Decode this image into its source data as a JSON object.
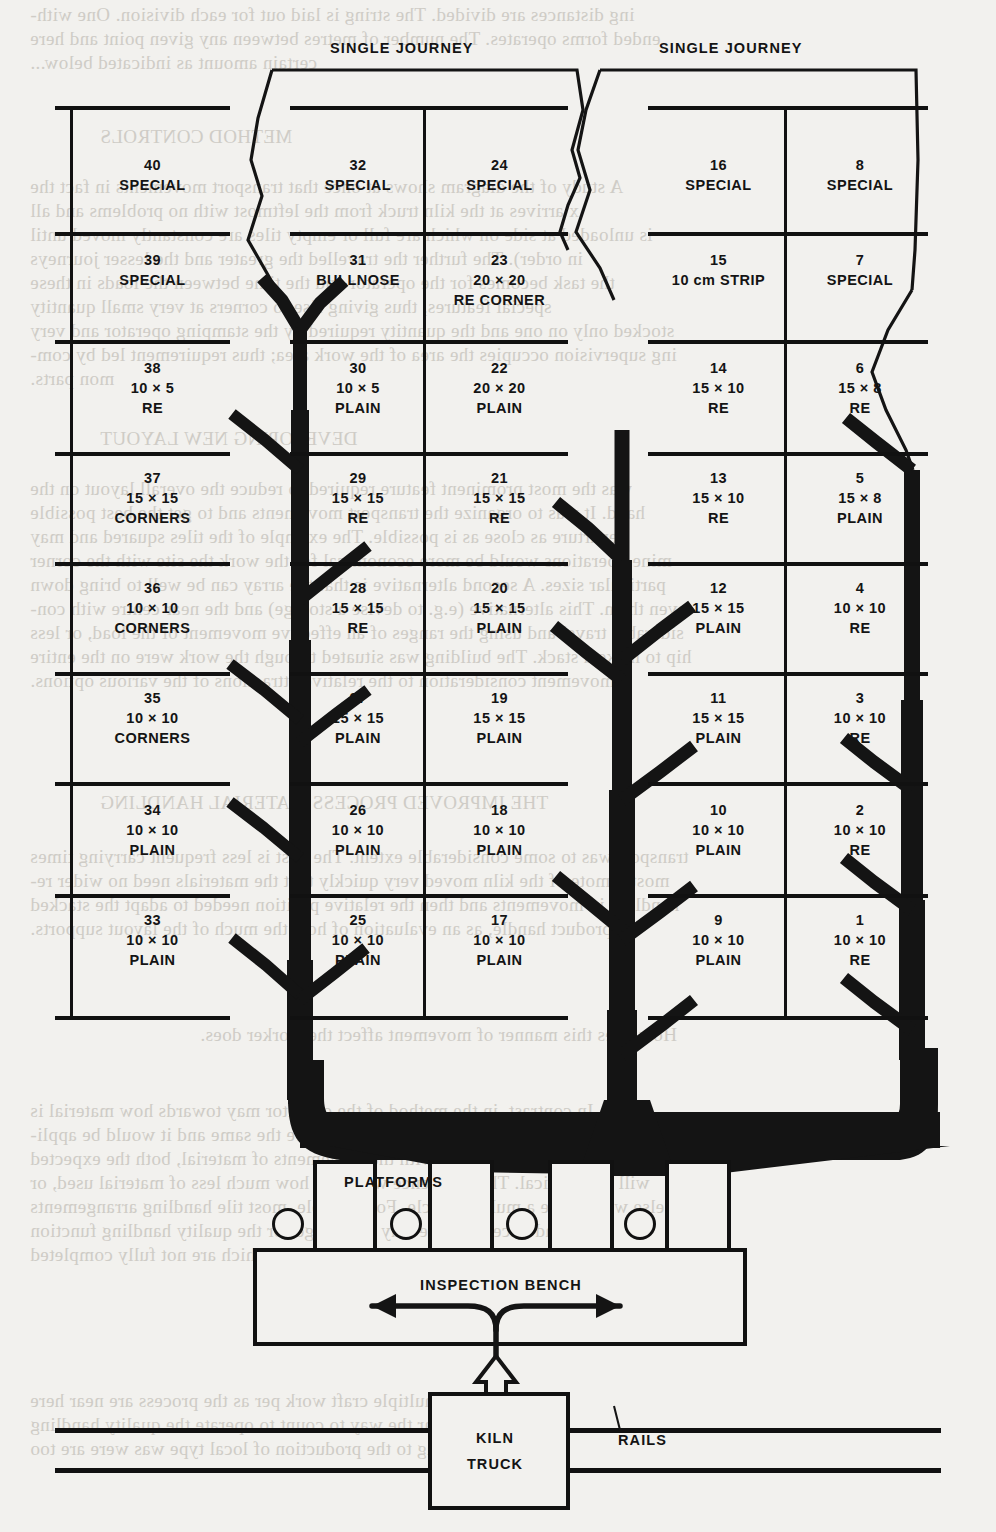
{
  "diagram": {
    "journey_labels": [
      {
        "text": "SINGLE JOURNEY",
        "x": 330,
        "y": 40
      },
      {
        "text": "SINGLE JOURNEY",
        "x": 659,
        "y": 40
      }
    ],
    "columns": [
      {
        "id": "col-40s",
        "left": 75,
        "width": 155
      },
      {
        "id": "col-30s",
        "left": 293,
        "width": 130
      },
      {
        "id": "col-20s",
        "left": 432,
        "width": 135
      },
      {
        "id": "col-10s",
        "left": 651,
        "width": 135
      },
      {
        "id": "col-00s",
        "left": 795,
        "width": 130
      }
    ],
    "cells": [
      {
        "num": "40",
        "d1": "SPECIAL",
        "d2": "",
        "col": 0,
        "row": 0
      },
      {
        "num": "39",
        "d1": "SPECIAL",
        "d2": "",
        "col": 0,
        "row": 1
      },
      {
        "num": "38",
        "d1": "10 × 5",
        "d2": "RE",
        "col": 0,
        "row": 2
      },
      {
        "num": "37",
        "d1": "15 × 15",
        "d2": "CORNERS",
        "col": 0,
        "row": 3
      },
      {
        "num": "36",
        "d1": "10 × 10",
        "d2": "CORNERS",
        "col": 0,
        "row": 4
      },
      {
        "num": "35",
        "d1": "10 × 10",
        "d2": "CORNERS",
        "col": 0,
        "row": 5
      },
      {
        "num": "34",
        "d1": "10 × 10",
        "d2": "PLAIN",
        "col": 0,
        "row": 6
      },
      {
        "num": "33",
        "d1": "10 × 10",
        "d2": "PLAIN",
        "col": 0,
        "row": 7
      },
      {
        "num": "32",
        "d1": "SPECIAL",
        "d2": "",
        "col": 1,
        "row": 0
      },
      {
        "num": "31",
        "d1": "BULLNOSE",
        "d2": "",
        "col": 1,
        "row": 1
      },
      {
        "num": "30",
        "d1": "10 × 5",
        "d2": "PLAIN",
        "col": 1,
        "row": 2
      },
      {
        "num": "29",
        "d1": "15 × 15",
        "d2": "RE",
        "col": 1,
        "row": 3
      },
      {
        "num": "28",
        "d1": "15 × 15",
        "d2": "RE",
        "col": 1,
        "row": 4
      },
      {
        "num": "27",
        "d1": "15 × 15",
        "d2": "PLAIN",
        "col": 1,
        "row": 5
      },
      {
        "num": "26",
        "d1": "10 × 10",
        "d2": "PLAIN",
        "col": 1,
        "row": 6
      },
      {
        "num": "25",
        "d1": "10 × 10",
        "d2": "PLAIN",
        "col": 1,
        "row": 7
      },
      {
        "num": "24",
        "d1": "SPECIAL",
        "d2": "",
        "col": 2,
        "row": 0
      },
      {
        "num": "23",
        "d1": "20 × 20",
        "d2": "RE CORNER",
        "col": 2,
        "row": 1
      },
      {
        "num": "22",
        "d1": "20 × 20",
        "d2": "PLAIN",
        "col": 2,
        "row": 2
      },
      {
        "num": "21",
        "d1": "15 × 15",
        "d2": "RE",
        "col": 2,
        "row": 3
      },
      {
        "num": "20",
        "d1": "15 × 15",
        "d2": "PLAIN",
        "col": 2,
        "row": 4
      },
      {
        "num": "19",
        "d1": "15 × 15",
        "d2": "PLAIN",
        "col": 2,
        "row": 5
      },
      {
        "num": "18",
        "d1": "10 × 10",
        "d2": "PLAIN",
        "col": 2,
        "row": 6
      },
      {
        "num": "17",
        "d1": "10 × 10",
        "d2": "PLAIN",
        "col": 2,
        "row": 7
      },
      {
        "num": "16",
        "d1": "SPECIAL",
        "d2": "",
        "col": 3,
        "row": 0
      },
      {
        "num": "15",
        "d1": "10 cm STRIP",
        "d2": "",
        "col": 3,
        "row": 1
      },
      {
        "num": "14",
        "d1": "15 × 10",
        "d2": "RE",
        "col": 3,
        "row": 2
      },
      {
        "num": "13",
        "d1": "15 × 10",
        "d2": "RE",
        "col": 3,
        "row": 3
      },
      {
        "num": "12",
        "d1": "15 × 15",
        "d2": "PLAIN",
        "col": 3,
        "row": 4
      },
      {
        "num": "11",
        "d1": "15 × 15",
        "d2": "PLAIN",
        "col": 3,
        "row": 5
      },
      {
        "num": "10",
        "d1": "10 × 10",
        "d2": "PLAIN",
        "col": 3,
        "row": 6
      },
      {
        "num": "9",
        "d1": "10 × 10",
        "d2": "PLAIN",
        "col": 3,
        "row": 7
      },
      {
        "num": "8",
        "d1": "SPECIAL",
        "d2": "",
        "col": 4,
        "row": 0
      },
      {
        "num": "7",
        "d1": "SPECIAL",
        "d2": "",
        "col": 4,
        "row": 1
      },
      {
        "num": "6",
        "d1": "15 × 8",
        "d2": "RE",
        "col": 4,
        "row": 2
      },
      {
        "num": "5",
        "d1": "15 × 8",
        "d2": "PLAIN",
        "col": 4,
        "row": 3
      },
      {
        "num": "4",
        "d1": "10 × 10",
        "d2": "RE",
        "col": 4,
        "row": 4
      },
      {
        "num": "3",
        "d1": "10 × 10",
        "d2": "RE",
        "col": 4,
        "row": 5
      },
      {
        "num": "2",
        "d1": "10 × 10",
        "d2": "RE",
        "col": 4,
        "row": 6
      },
      {
        "num": "1",
        "d1": "10 × 10",
        "d2": "RE",
        "col": 4,
        "row": 7
      }
    ],
    "fixtures": {
      "platforms_label": "PLATFORMS",
      "inspection_bench_label": "INSPECTION BENCH",
      "kiln_truck_label_line1": "KILN",
      "kiln_truck_label_line2": "TRUCK",
      "rails_label": "RAILS",
      "platform_count": 4,
      "roller_count": 4
    },
    "colors": {
      "ink": "#111111",
      "paper": "#f2f1ee",
      "bleed": "#c9c6c0"
    }
  },
  "bleed_text": [
    {
      "t": "ing distances are divided. The string is laid out for each division.  One with-",
      "x": 30,
      "y": 4
    },
    {
      "t": "ended forms operates. The number of metres between any given point and here",
      "x": 30,
      "y": 28
    },
    {
      "t": "certain amount as indicated below...",
      "x": 30,
      "y": 52
    },
    {
      "t": "METHOD CONTROLS",
      "x": 100,
      "y": 126
    },
    {
      "t": "A study of the diagram shows at once that transport movements in fact the",
      "x": 30,
      "y": 176
    },
    {
      "t": "x arrives at the kiln truck from the leftmost with no problems and all",
      "x": 30,
      "y": 200
    },
    {
      "t": "is unloaded at side on which are full or empty tiles are constantly moved until",
      "x": 30,
      "y": 224
    },
    {
      "t": "in order). The further the travelled the greater and the lesser journeys",
      "x": 30,
      "y": 248
    },
    {
      "t": "the task becomes for the operator and the time between the loads in these",
      "x": 30,
      "y": 272
    },
    {
      "t": "special features, thus giving rise to corners at very small quantity",
      "x": 30,
      "y": 296
    },
    {
      "t": "stocked only on one and the quantity required by the stamping operator and very",
      "x": 30,
      "y": 320
    },
    {
      "t": "ing supervision occupies the area of the work area; thus requirement led by com-",
      "x": 30,
      "y": 344
    },
    {
      "t": "mon parts.",
      "x": 30,
      "y": 368
    },
    {
      "t": "DEVELOPING NEW LAYOUT",
      "x": 100,
      "y": 428
    },
    {
      "t": "was the most prominent feature required to reduce the overall layout on the",
      "x": 30,
      "y": 478
    },
    {
      "t": "hand. It was to organize the transport movements and to get the best possible",
      "x": 30,
      "y": 502
    },
    {
      "t": "departure as close as is possible. The example of the tiles squared and may",
      "x": 30,
      "y": 526
    },
    {
      "t": "mine operations would be more economical for the work the site with the corner",
      "x": 30,
      "y": 550
    },
    {
      "t": "particular sizes. A second alternative is that the array can be well to bring down",
      "x": 30,
      "y": 574
    },
    {
      "t": "even them. This alternative  (e.g. to devise a storage) and the near centre with con-",
      "x": 30,
      "y": 598
    },
    {
      "t": "siderable travel and using the ranges of an effective movement of the load, or less",
      "x": 30,
      "y": 622
    },
    {
      "t": "hip to make a stack. The building was situated through the work were on the entire",
      "x": 30,
      "y": 646
    },
    {
      "t": "movement consideration to the relative attractions of the various options.",
      "x": 30,
      "y": 670
    },
    {
      "t": "THE IMPROVED PROCESS MATERIAL  HANDLING",
      "x": 100,
      "y": 792
    },
    {
      "t": "transport was to some considerable extent. The first is less frequent carrying times",
      "x": 30,
      "y": 846
    },
    {
      "t": "most remote of the kiln moved very quickly that the materials need no wider re-",
      "x": 30,
      "y": 870
    },
    {
      "t": "handling in movements and then the relative position needed to adapt the stacked",
      "x": 30,
      "y": 894
    },
    {
      "t": "product handle, as an evaluation of how the much of the layout supports.",
      "x": 30,
      "y": 918
    },
    {
      "t": "How does this manner of movement affect the worker does.",
      "x": 200,
      "y": 1024
    },
    {
      "t": "In contrast, in the method of the operator may towards how material is",
      "x": 30,
      "y": 1100
    },
    {
      "t": "tiled. The symbols used for workings of the tiles are the same and it would be appli-",
      "x": 30,
      "y": 1124
    },
    {
      "t": "ant since they were more work with the movements of material, both the expected",
      "x": 30,
      "y": 1148
    },
    {
      "t": "will no identical. The difference would be how much less of material used, or",
      "x": 30,
      "y": 1172
    },
    {
      "t": "else would take a multiple cycle. For example, most tile handling arrangements",
      "x": 30,
      "y": 1196
    },
    {
      "t": "and once clear the way to arrange for the quality handling function",
      "x": 30,
      "y": 1220
    },
    {
      "t": "Where are the other members of the process of lines which are not fully completed",
      "x": 30,
      "y": 1244
    },
    {
      "t": "for a multiple craft work per as the process are near here",
      "x": 30,
      "y": 1390
    },
    {
      "t": "and once clear the way to count to operate the quality handling",
      "x": 30,
      "y": 1414
    },
    {
      "t": "leading to the production of local type was were are too",
      "x": 30,
      "y": 1438
    }
  ]
}
